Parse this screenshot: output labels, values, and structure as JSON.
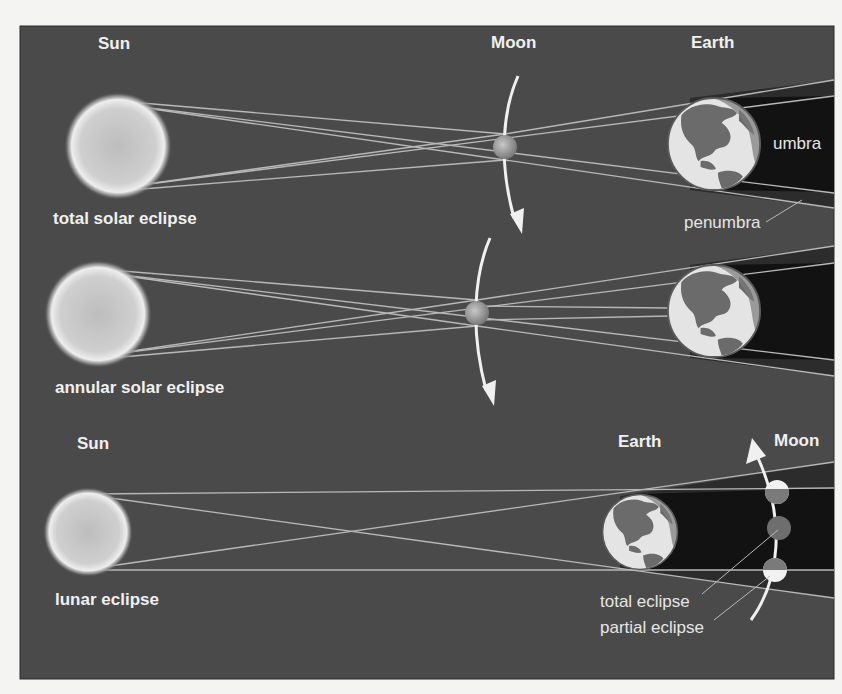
{
  "colors": {
    "frame_bg": "#4a4a4a",
    "umbra": "#121212",
    "penumbra": "#2c2c2c",
    "ray": "#b9b9b9",
    "sun": "#cfcfcf",
    "earth_ocean": "#e4e4e4",
    "earth_land": "#6b6b6b",
    "moon": "#9a9a9a",
    "moon_eclipsed": "#6e6e6e",
    "text": "#f0f0f0"
  },
  "panels": [
    {
      "id": "total-solar-eclipse",
      "caption": "total solar eclipse",
      "labels": {
        "sun": "Sun",
        "moon": "Moon",
        "earth": "Earth",
        "umbra": "umbra",
        "penumbra": "penumbra"
      }
    },
    {
      "id": "annular-solar-eclipse",
      "caption": "annular solar eclipse",
      "labels": {}
    },
    {
      "id": "lunar-eclipse",
      "caption": "lunar eclipse",
      "labels": {
        "sun": "Sun",
        "earth": "Earth",
        "moon": "Moon",
        "total": "total eclipse",
        "partial": "partial eclipse"
      }
    }
  ]
}
